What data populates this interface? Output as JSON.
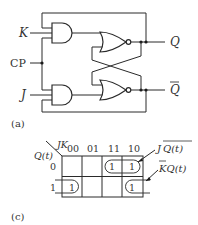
{
  "figure_a": {
    "caption": "(a)",
    "inputs": {
      "k_label": "K",
      "cp_label": "CP",
      "j_label": "J"
    },
    "outputs": {
      "q_label": "Q",
      "qbar_label": "Q"
    },
    "gates": [
      {
        "name": "and-gate-k",
        "type": "AND",
        "inputs": [
          "Q (feedback)",
          "K",
          "CP"
        ]
      },
      {
        "name": "and-gate-j",
        "type": "AND",
        "inputs": [
          "CP",
          "J",
          "Q̄ (feedback)"
        ]
      },
      {
        "name": "nor-gate-top",
        "type": "NOR",
        "output": "Q"
      },
      {
        "name": "nor-gate-bottom",
        "type": "NOR",
        "output": "Q̄"
      }
    ]
  },
  "figure_c": {
    "caption": "(c)",
    "row_var": "Q(t)",
    "col_var": "JK",
    "col_headers": [
      "00",
      "01",
      "11",
      "10"
    ],
    "row_headers": [
      "0",
      "1"
    ],
    "cells": [
      [
        "",
        "",
        "1",
        "1"
      ],
      [
        "1",
        "",
        "",
        "1"
      ]
    ],
    "group_labels": {
      "top": "J Q(t)",
      "top_overline": "Q(t)",
      "top_prefix": "J",
      "bottom": "KQ(t)",
      "bottom_overline": "K",
      "bottom_suffix": "Q(t)"
    }
  }
}
